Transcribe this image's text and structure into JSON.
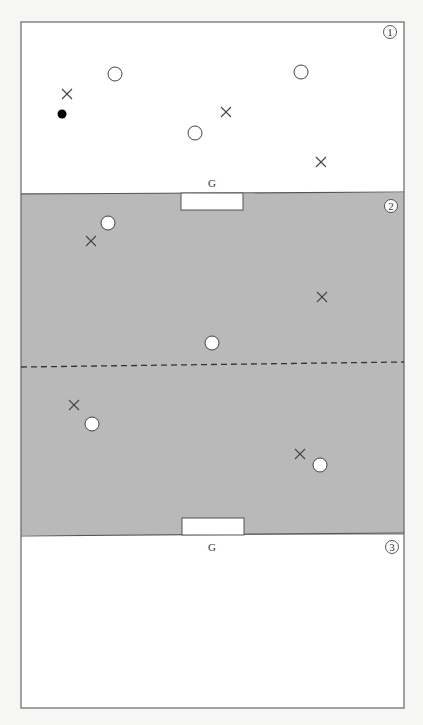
{
  "diagram": {
    "type": "game-field-zones",
    "colors": {
      "page": "#f6f6f4",
      "zone_white": "#ffffff",
      "zone_grey": "#b9b9b9",
      "line": "#555555",
      "marker": "#444444",
      "ball": "#000000"
    },
    "frame": {
      "x": 21,
      "y": 22,
      "width": 383,
      "height": 686
    },
    "zones": [
      {
        "id": 1,
        "label": "1",
        "badge": "①",
        "fill": "white",
        "y_top": 22,
        "y_bottom": 193
      },
      {
        "id": 2,
        "label": "2",
        "badge": "②",
        "fill": "grey",
        "y_top": 193,
        "y_bottom": 535
      },
      {
        "id": 3,
        "label": "3",
        "badge": "③",
        "fill": "white",
        "y_top": 535,
        "y_bottom": 708
      }
    ],
    "goals": [
      {
        "label": "G",
        "label_pos": [
          212,
          187
        ],
        "box": {
          "x": 181,
          "y": 193,
          "w": 62,
          "h": 17
        }
      },
      {
        "label": "G",
        "label_pos": [
          212,
          551
        ],
        "box": {
          "x": 182,
          "y": 518,
          "w": 62,
          "h": 17
        }
      }
    ],
    "halfway_line": {
      "style": "dashed",
      "y_left": 367,
      "y_right": 362,
      "x1": 21,
      "x2": 404
    },
    "players": {
      "circles": [
        {
          "zone": 1,
          "x": 115,
          "y": 74
        },
        {
          "zone": 1,
          "x": 301,
          "y": 72
        },
        {
          "zone": 1,
          "x": 195,
          "y": 133
        },
        {
          "zone": 2,
          "x": 108,
          "y": 223
        },
        {
          "zone": 2,
          "x": 212,
          "y": 343
        },
        {
          "zone": 2,
          "x": 92,
          "y": 424
        },
        {
          "zone": 2,
          "x": 320,
          "y": 465
        }
      ],
      "crosses": [
        {
          "zone": 1,
          "x": 67,
          "y": 94
        },
        {
          "zone": 1,
          "x": 226,
          "y": 112
        },
        {
          "zone": 1,
          "x": 321,
          "y": 162
        },
        {
          "zone": 2,
          "x": 91,
          "y": 241
        },
        {
          "zone": 2,
          "x": 322,
          "y": 297
        },
        {
          "zone": 2,
          "x": 74,
          "y": 405
        },
        {
          "zone": 2,
          "x": 300,
          "y": 454
        }
      ],
      "ball": {
        "zone": 1,
        "x": 62,
        "y": 114
      }
    }
  }
}
